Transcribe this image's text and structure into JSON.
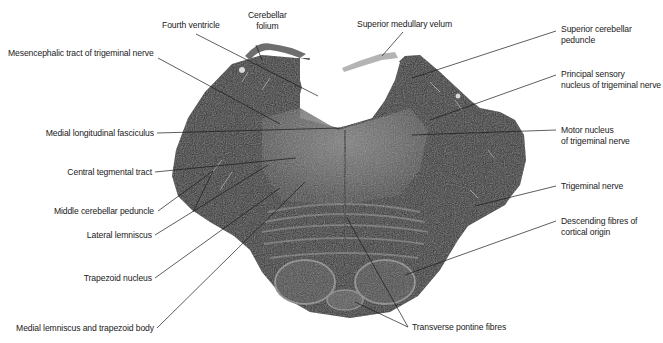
{
  "figure": {
    "colors": {
      "background": "#ffffff",
      "tissue_dark": "#2b2b2b",
      "tissue_mid": "#5a5a5a",
      "tissue_light": "#9a9a9a",
      "leader_line": "#1a1a1a",
      "label_text": "#1a1a1a"
    }
  },
  "labels": {
    "cerebellar_folium": {
      "line1": "Cerebellar",
      "line2": "folium"
    },
    "fourth_ventricle": "Fourth ventricle",
    "mesencephalic_tract": "Mesencephalic tract of trigeminal nerve",
    "superior_medullary_velum": "Superior medullary velum",
    "superior_cerebellar_peduncle": {
      "line1": "Superior cerebellar",
      "line2": "peduncle"
    },
    "principal_sensory_nucleus": {
      "line1": "Principal sensory",
      "line2": "nucleus of trigeminal nerve"
    },
    "medial_longitudinal_fasciculus": "Medial longitudinal fasciculus",
    "motor_nucleus": {
      "line1": "Motor nucleus",
      "line2": "of trigeminal nerve"
    },
    "central_tegmental_tract": "Central tegmental tract",
    "trigeminal_nerve": "Trigeminal nerve",
    "middle_cerebellar_peduncle": "Middle cerebellar peduncle",
    "descending_fibres": {
      "line1": "Descending fibres of",
      "line2": "cortical origin"
    },
    "lateral_lemniscus": "Lateral lemniscus",
    "trapezoid_nucleus": "Trapezoid nucleus",
    "medial_lemniscus_trapezoid_body": "Medial lemniscus and trapezoid body",
    "transverse_pontine_fibres": "Transverse pontine fibres"
  }
}
